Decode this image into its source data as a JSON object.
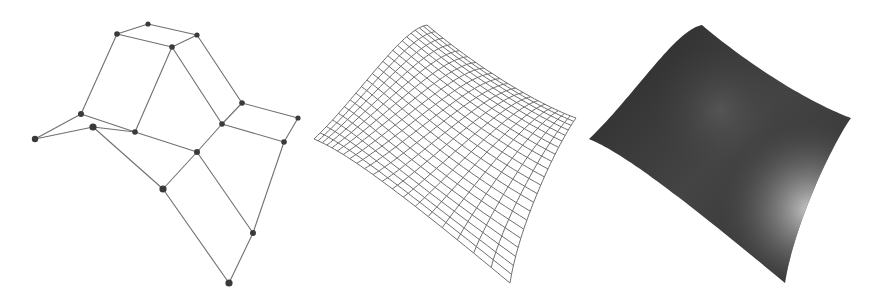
{
  "figure": {
    "width": 888,
    "height": 301,
    "background": "#ffffff",
    "panels": [
      {
        "id": "control-net",
        "type": "control-polygon",
        "line_color": "#707070",
        "point_color": "#3a3a3a",
        "points": [
          [
            148,
            24
          ],
          [
            117,
            34
          ],
          [
            197,
            35
          ],
          [
            172,
            47
          ],
          [
            81,
            114
          ],
          [
            35,
            139
          ],
          [
            93,
            127
          ],
          [
            135,
            132
          ],
          [
            242,
            103
          ],
          [
            298,
            118
          ],
          [
            222,
            124
          ],
          [
            284,
            142
          ],
          [
            197,
            152
          ],
          [
            163,
            189
          ],
          [
            253,
            233
          ],
          [
            229,
            283
          ]
        ],
        "point_radius": [
          2.6,
          2.8,
          2.6,
          2.8,
          3.0,
          3.2,
          3.6,
          2.8,
          2.8,
          2.6,
          2.8,
          2.8,
          3.0,
          3.6,
          3.0,
          3.6
        ],
        "edges": [
          [
            0,
            1
          ],
          [
            0,
            2
          ],
          [
            1,
            3
          ],
          [
            2,
            3
          ],
          [
            1,
            4
          ],
          [
            3,
            7
          ],
          [
            3,
            10
          ],
          [
            2,
            8
          ],
          [
            4,
            5
          ],
          [
            4,
            7
          ],
          [
            5,
            6
          ],
          [
            6,
            7
          ],
          [
            7,
            12
          ],
          [
            6,
            13
          ],
          [
            12,
            13
          ],
          [
            10,
            12
          ],
          [
            8,
            9
          ],
          [
            8,
            10
          ],
          [
            10,
            11
          ],
          [
            9,
            11
          ],
          [
            12,
            14
          ],
          [
            11,
            14
          ],
          [
            13,
            15
          ],
          [
            14,
            15
          ]
        ]
      },
      {
        "id": "wireframe-surface",
        "type": "mesh",
        "line_color": "#6e6e6e",
        "grid_u": 20,
        "grid_v": 22,
        "offset_x": 0,
        "patch": [
          [
            [
              314,
              139
            ],
            [
              360,
              95
            ],
            [
              400,
              30
            ],
            [
              427,
              25
            ]
          ],
          [
            [
              340,
              150
            ],
            [
              390,
              120
            ],
            [
              450,
              70
            ],
            [
              480,
              70
            ]
          ],
          [
            [
              380,
              175
            ],
            [
              420,
              175
            ],
            [
              500,
              105
            ],
            [
              540,
              105
            ]
          ],
          [
            [
              510,
              283
            ],
            [
              520,
              220
            ],
            [
              560,
              140
            ],
            [
              576,
              118
            ]
          ]
        ]
      },
      {
        "id": "shaded-surface",
        "type": "shaded",
        "base_color": "#2e2e2e",
        "mid_color": "#4a4a4a",
        "highlight_color": "#c8c8c8",
        "highlight_center": [
          810,
          210
        ],
        "offset_x": 275,
        "patch": [
          [
            [
              314,
              139
            ],
            [
              360,
              95
            ],
            [
              400,
              30
            ],
            [
              427,
              25
            ]
          ],
          [
            [
              340,
              150
            ],
            [
              390,
              120
            ],
            [
              450,
              70
            ],
            [
              480,
              70
            ]
          ],
          [
            [
              380,
              175
            ],
            [
              420,
              175
            ],
            [
              500,
              105
            ],
            [
              540,
              105
            ]
          ],
          [
            [
              510,
              283
            ],
            [
              520,
              220
            ],
            [
              560,
              140
            ],
            [
              576,
              118
            ]
          ]
        ]
      }
    ]
  }
}
